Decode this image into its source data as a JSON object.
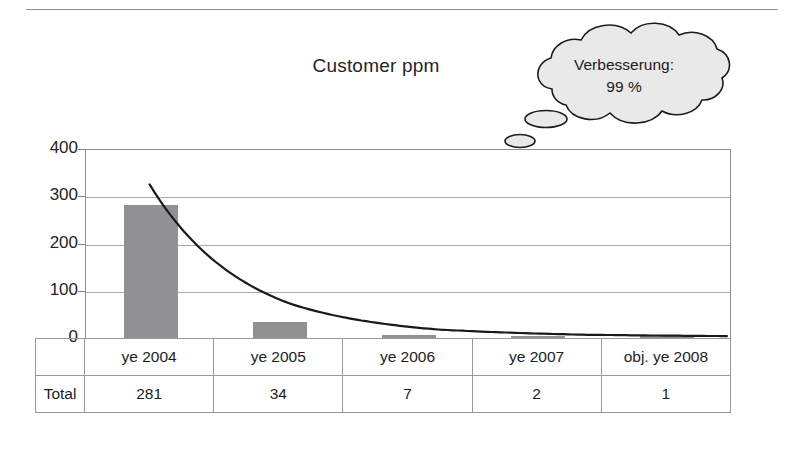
{
  "chart_data": {
    "type": "bar",
    "title": "Customer ppm",
    "xlabel": "",
    "ylabel": "",
    "categories": [
      "ye 2004",
      "ye 2005",
      "ye 2006",
      "ye 2007",
      "obj. ye 2008"
    ],
    "values": [
      281,
      34,
      7,
      2,
      1
    ],
    "series": [
      {
        "name": "Total",
        "type": "bar",
        "values": [
          281,
          34,
          7,
          2,
          1
        ]
      },
      {
        "name": "trendline",
        "type": "line",
        "values": [
          325,
          70,
          18,
          7,
          4
        ]
      }
    ],
    "ylim": [
      0,
      400
    ],
    "yticks": [
      0,
      100,
      200,
      300,
      400
    ],
    "ytick_labels": [
      "0",
      "100",
      "200",
      "300",
      "400"
    ],
    "grid": true,
    "legend": "none",
    "bar_color": "#919193",
    "line_color": "#1a1a1a",
    "annotations": [
      {
        "kind": "thought-bubble",
        "line1": "Verbesserung:",
        "line2": "99 %"
      }
    ]
  },
  "title": {
    "text": "Customer ppm"
  },
  "bubble": {
    "line1": "Verbesserung:",
    "line2": "99 %"
  },
  "axis": {
    "y_labels": [
      "400",
      "300",
      "200",
      "100",
      "0"
    ]
  },
  "table": {
    "row_label": "Total",
    "headers": [
      "ye 2004",
      "ye 2005",
      "ye 2006",
      "ye 2007",
      "obj. ye 2008"
    ],
    "values": [
      "281",
      "34",
      "7",
      "2",
      "1"
    ]
  }
}
